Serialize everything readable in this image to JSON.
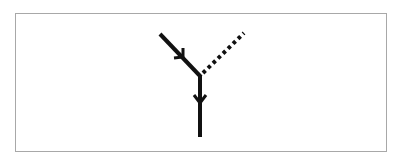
{
  "diagram": {
    "type": "feynman-vertex",
    "frame": {
      "border_color": "#a8a8a8",
      "background": "#ffffff"
    },
    "line_color": "#111111",
    "vertex": {
      "x": 200,
      "y": 76
    },
    "lines": [
      {
        "id": "incoming-fermion",
        "style": "solid",
        "from": [
          160,
          34
        ],
        "to": [
          200,
          76
        ],
        "arrow": "toward-vertex"
      },
      {
        "id": "outgoing-fermion",
        "style": "solid",
        "from": [
          200,
          76
        ],
        "to": [
          200,
          136
        ],
        "arrow": "away-from-vertex"
      },
      {
        "id": "scalar-boson",
        "style": "dotted",
        "from": [
          200,
          76
        ],
        "to": [
          244,
          33
        ],
        "arrow": "none"
      }
    ]
  }
}
